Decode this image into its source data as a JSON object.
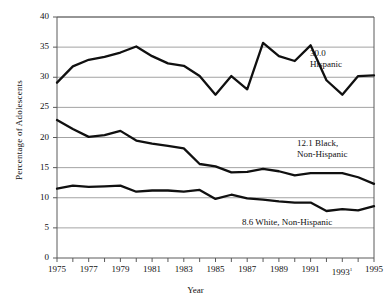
{
  "chart_data": {
    "type": "line",
    "title": "",
    "xlabel": "Year",
    "ylabel": "Percentage of Adolescents",
    "xlim": [
      1975,
      1995
    ],
    "ylim": [
      0,
      40
    ],
    "ytick_step": 5,
    "grid": true,
    "legend_position": "inline-right",
    "x": [
      1975,
      1976,
      1977,
      1978,
      1979,
      1980,
      1981,
      1982,
      1983,
      1984,
      1985,
      1986,
      1987,
      1988,
      1989,
      1990,
      1991,
      1992,
      1993,
      1994,
      1995
    ],
    "yticks": [
      0,
      5,
      10,
      15,
      20,
      25,
      30,
      35,
      40
    ],
    "xticks": [
      1975,
      1976,
      1977,
      1978,
      1979,
      1980,
      1981,
      1982,
      1983,
      1984,
      1985,
      1986,
      1987,
      1988,
      1989,
      1990,
      1991,
      1992,
      1993,
      1994,
      1995
    ],
    "xtick_labels": [
      {
        "value": 1975,
        "text": "1975",
        "footnote": ""
      },
      {
        "value": 1977,
        "text": "1977",
        "footnote": ""
      },
      {
        "value": 1979,
        "text": "1979",
        "footnote": ""
      },
      {
        "value": 1981,
        "text": "1981",
        "footnote": ""
      },
      {
        "value": 1983,
        "text": "1983",
        "footnote": ""
      },
      {
        "value": 1985,
        "text": "1985",
        "footnote": ""
      },
      {
        "value": 1987,
        "text": "1987",
        "footnote": ""
      },
      {
        "value": 1989,
        "text": "1989",
        "footnote": ""
      },
      {
        "value": 1991,
        "text": "1991",
        "footnote": ""
      },
      {
        "value": 1993,
        "text": "1993",
        "footnote": "1"
      },
      {
        "value": 1995,
        "text": "1995",
        "footnote": ""
      }
    ],
    "series": [
      {
        "name": "Hispanic",
        "color": "#101010",
        "end_value": 30.0,
        "annotation_line1": "30.0",
        "annotation_line2": "Hispanic",
        "values": [
          29.1,
          31.8,
          32.9,
          33.4,
          34.1,
          35.1,
          33.5,
          32.3,
          31.9,
          30.2,
          27.1,
          30.2,
          28.0,
          35.7,
          33.5,
          32.7,
          35.3,
          29.5,
          27.1,
          30.2,
          30.3
        ]
      },
      {
        "name": "Black, Non-Hispanic",
        "color": "#101010",
        "end_value": 12.1,
        "annotation_line1": "12.1 Black,",
        "annotation_line2": "Non-Hispanic",
        "values": [
          22.9,
          21.4,
          20.1,
          20.4,
          21.1,
          19.5,
          19.0,
          18.6,
          18.2,
          15.6,
          15.2,
          14.2,
          14.3,
          14.8,
          14.4,
          13.7,
          14.1,
          14.1,
          14.1,
          13.4,
          12.3
        ]
      },
      {
        "name": "White, Non-Hispanic",
        "color": "#101010",
        "end_value": 8.6,
        "annotation_line1": "8.6 White, Non-Hispanic",
        "annotation_line2": "",
        "values": [
          11.5,
          12.0,
          11.8,
          11.9,
          12.0,
          11.0,
          11.2,
          11.2,
          11.0,
          11.3,
          9.8,
          10.5,
          9.9,
          9.7,
          9.4,
          9.2,
          9.2,
          7.8,
          8.1,
          7.9,
          8.6
        ]
      }
    ]
  },
  "annotations": {
    "hispanic": {
      "line1": "30.0",
      "line2": "Hispanic"
    },
    "black": {
      "line1": "12.1 Black,",
      "line2": "Non-Hispanic"
    },
    "white": {
      "line1": "8.6 White, Non-Hispanic"
    }
  },
  "axes": {
    "y_title": "Percentage of Adolescents",
    "x_title": "Year"
  }
}
